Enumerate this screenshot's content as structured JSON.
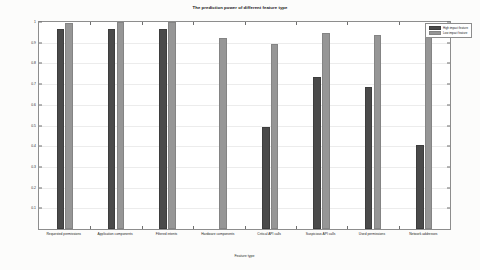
{
  "chart_data": {
    "type": "bar",
    "title": "The prediction power of different feature type",
    "xlabel": "Feature type",
    "ylabel": "Prediction power",
    "ylim": [
      0,
      1
    ],
    "yticks": [
      "0.1",
      "0.2",
      "0.3",
      "0.4",
      "0.5",
      "0.6",
      "0.7",
      "0.8",
      "0.9",
      "1"
    ],
    "grid": true,
    "legend_position": "top-right",
    "categories": [
      "Requested permissions",
      "Application components",
      "Filtered intents",
      "Hardware components",
      "Critical API calls",
      "Suspicious API calls",
      "Used permissions",
      "Network addresses"
    ],
    "series": [
      {
        "name": "High impact feature",
        "color": "#4a4a4a",
        "values": [
          0.965,
          0.968,
          0.966,
          0.0,
          0.495,
          0.735,
          0.685,
          0.405
        ]
      },
      {
        "name": "Low impact feature",
        "color": "#969696",
        "values": [
          0.995,
          1.0,
          1.0,
          0.925,
          0.895,
          0.945,
          0.935,
          0.93
        ]
      }
    ]
  },
  "figure": {
    "background_color": "#fcfcfb",
    "plot_background_color": "#ffffff",
    "axis_color": "#8d8d8d",
    "grid_color": "#ececec"
  }
}
